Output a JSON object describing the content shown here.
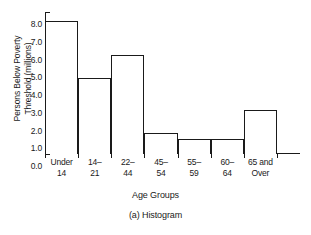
{
  "chart_data": {
    "type": "bar",
    "title": "",
    "caption": "(a) Histogram",
    "xlabel": "Age Groups",
    "ylabel": "Persons Below Poverty Threshold (millions)",
    "ylabel_lines": [
      "Persons Below Poverty",
      "Threshold (millions)"
    ],
    "categories": [
      "Under 14",
      "14– 21",
      "22– 44",
      "45– 54",
      "55– 59",
      "60– 64",
      "65 and Over"
    ],
    "category_lines": [
      [
        "Under",
        "14"
      ],
      [
        "14–",
        "21"
      ],
      [
        "22–",
        "44"
      ],
      [
        "45–",
        "54"
      ],
      [
        "55–",
        "59"
      ],
      [
        "60–",
        "64"
      ],
      [
        "65 and",
        "Over"
      ]
    ],
    "values": [
      7.5,
      4.3,
      5.6,
      1.2,
      0.85,
      0.85,
      2.5
    ],
    "ylim": [
      0.0,
      8.0
    ],
    "ytick_values": [
      0.0,
      1.0,
      2.0,
      3.0,
      4.0,
      5.0,
      6.0,
      7.0,
      8.0
    ],
    "ytick_labels": [
      "0.0",
      "1.0",
      "2.0",
      "3.0",
      "4.0",
      "5.0",
      "6.0",
      "7.0",
      "8.0"
    ],
    "grid": false,
    "legend": null,
    "bar_fill": "#ffffff",
    "bar_edge_color": "#1a1a1a",
    "axis_color": "#1a1a1a",
    "background": "#ffffff"
  }
}
